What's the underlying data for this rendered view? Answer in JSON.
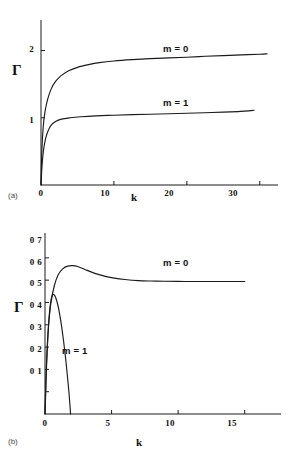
{
  "figure": {
    "panels": [
      {
        "tag": "(a)",
        "xlabel": "k",
        "ylabel": "Γ",
        "xticks": [
          "0",
          "10",
          "20",
          "30"
        ],
        "yticks": [
          "1",
          "2"
        ],
        "curve_labels": [
          "m = 0",
          "m = 1"
        ]
      },
      {
        "tag": "(b)",
        "xlabel": "k",
        "ylabel": "Γ",
        "xticks": [
          "0",
          "5",
          "10",
          "15"
        ],
        "yticks": [
          "0 7",
          "0 6",
          "0 5",
          "0 4",
          "0 3",
          "0 2",
          "0 1"
        ],
        "curve_labels": [
          "m = 0",
          "m = 1"
        ]
      }
    ],
    "caption_fragment": ""
  },
  "chart_data": [
    {
      "type": "line",
      "title": "",
      "panel": "(a)",
      "xlabel": "k",
      "ylabel": "Γ",
      "xlim": [
        0,
        32.5
      ],
      "ylim": [
        0,
        2.35
      ],
      "xticks": [
        0,
        10,
        20,
        30
      ],
      "yticks": [
        1,
        2
      ],
      "grid": false,
      "legend_position": "inline-annotation",
      "series": [
        {
          "name": "m = 0",
          "label_at": {
            "x": 19.0,
            "y": 2.12
          },
          "x": [
            0,
            0.12,
            0.3,
            0.55,
            0.9,
            1.4,
            2.0,
            2.8,
            3.8,
            5.0,
            6.5,
            8.0,
            10.0,
            12.5,
            15.0,
            17.5,
            20.0,
            22.5,
            25.0,
            27.5,
            30.0,
            31.0
          ],
          "y": [
            0,
            0.52,
            0.86,
            1.09,
            1.27,
            1.43,
            1.54,
            1.63,
            1.7,
            1.75,
            1.79,
            1.82,
            1.845,
            1.865,
            1.88,
            1.89,
            1.9,
            1.915,
            1.925,
            1.935,
            1.945,
            1.95
          ]
        },
        {
          "name": "m = 1",
          "label_at": {
            "x": 19.0,
            "y": 1.3
          },
          "x": [
            0,
            0.15,
            0.35,
            0.6,
            0.95,
            1.4,
            2.0,
            2.8,
            4.0,
            5.5,
            7.5,
            10.0,
            12.5,
            15.0,
            17.5,
            20.0,
            22.5,
            25.0,
            27.0,
            28.5,
            29.2
          ],
          "y": [
            0,
            0.3,
            0.52,
            0.68,
            0.8,
            0.89,
            0.945,
            0.98,
            1.0,
            1.015,
            1.028,
            1.038,
            1.046,
            1.053,
            1.06,
            1.067,
            1.075,
            1.083,
            1.092,
            1.102,
            1.112
          ]
        }
      ]
    },
    {
      "type": "line",
      "title": "",
      "panel": "(b)",
      "xlabel": "k",
      "ylabel": "Γ",
      "xlim": [
        0,
        17.5
      ],
      "ylim": [
        0,
        0.78
      ],
      "xticks": [
        0,
        5,
        10,
        15
      ],
      "yticks": [
        0.1,
        0.2,
        0.3,
        0.4,
        0.5,
        0.6,
        0.7
      ],
      "grid": false,
      "legend_position": "inline-annotation",
      "series": [
        {
          "name": "m = 0",
          "label_at": {
            "x": 9.2,
            "y": 0.625
          },
          "x": [
            0,
            0.1,
            0.25,
            0.45,
            0.7,
            1.0,
            1.35,
            1.7,
            2.1,
            2.5,
            3.0,
            3.5,
            4.0,
            4.6,
            5.2,
            6.0,
            7.0,
            8.0,
            9.0,
            10.5,
            12.0,
            13.5,
            15.0
          ],
          "y": [
            0,
            0.21,
            0.38,
            0.5,
            0.575,
            0.625,
            0.652,
            0.663,
            0.665,
            0.66,
            0.648,
            0.636,
            0.626,
            0.616,
            0.609,
            0.603,
            0.598,
            0.596,
            0.595,
            0.594,
            0.594,
            0.594,
            0.594
          ]
        },
        {
          "name": "m = 1",
          "label_at": {
            "x": 2.0,
            "y": 0.285
          },
          "x": [
            0,
            0.05,
            0.12,
            0.2,
            0.3,
            0.42,
            0.55,
            0.68,
            0.8,
            0.95,
            1.1,
            1.25,
            1.4,
            1.55,
            1.7,
            1.8,
            1.88,
            1.92
          ],
          "y": [
            0,
            0.09,
            0.22,
            0.33,
            0.43,
            0.5,
            0.532,
            0.535,
            0.522,
            0.492,
            0.448,
            0.392,
            0.325,
            0.248,
            0.16,
            0.095,
            0.035,
            0.0
          ]
        }
      ]
    }
  ]
}
